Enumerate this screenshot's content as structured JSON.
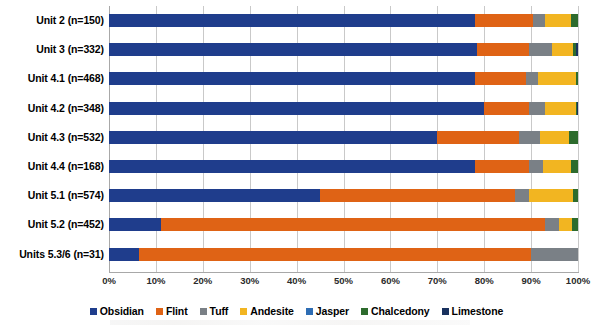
{
  "chart_data": {
    "type": "bar",
    "orientation": "horizontal",
    "stacked": true,
    "normalized": "percent",
    "title": "",
    "subtitle": "",
    "xlabel": "",
    "ylabel": "",
    "xlim": [
      0,
      100
    ],
    "grid": true,
    "legend_position": "bottom",
    "categories": [
      "Unit 2 (n=150)",
      "Unit 3 (n=332)",
      "Unit 4.1 (n=468)",
      "Unit 4.2 (n=348)",
      "Unit 4.3 (n=532)",
      "Unit 4.4 (n=168)",
      "Unit 5.1 (n=574)",
      "Unit 5.2 (n=452)",
      "Units 5.3/6 (n=31)"
    ],
    "xticks": [
      "0%",
      "10%",
      "20%",
      "30%",
      "40%",
      "50%",
      "60%",
      "70%",
      "80%",
      "90%",
      "100%"
    ],
    "xtick_values": [
      0,
      10,
      20,
      30,
      40,
      50,
      60,
      70,
      80,
      90,
      100
    ],
    "series": [
      {
        "name": "Obsidian",
        "color": "#1f3d8c",
        "values": [
          78.0,
          78.5,
          78.0,
          80.0,
          70.0,
          78.0,
          45.0,
          11.0,
          6.5
        ]
      },
      {
        "name": "Flint",
        "color": "#df6315",
        "values": [
          12.5,
          11.0,
          11.0,
          9.5,
          17.5,
          11.5,
          41.5,
          82.0,
          83.5
        ]
      },
      {
        "name": "Tuff",
        "color": "#7a8086",
        "values": [
          2.5,
          5.0,
          2.5,
          3.5,
          4.5,
          3.0,
          3.0,
          3.0,
          10.0
        ]
      },
      {
        "name": "Andesite",
        "color": "#f2b521",
        "values": [
          5.5,
          4.5,
          8.0,
          6.5,
          6.0,
          6.0,
          9.5,
          2.8,
          0.0
        ]
      },
      {
        "name": "Jasper",
        "color": "#2e6db4",
        "values": [
          0.0,
          0.0,
          0.0,
          0.0,
          0.0,
          0.0,
          0.0,
          0.0,
          0.0
        ]
      },
      {
        "name": "Chalcedony",
        "color": "#2d6b2d",
        "values": [
          1.5,
          0.6,
          0.5,
          0.3,
          2.0,
          1.5,
          1.0,
          1.2,
          0.0
        ]
      },
      {
        "name": "Limestone",
        "color": "#19315e",
        "values": [
          0.0,
          0.4,
          0.0,
          0.2,
          0.0,
          0.0,
          0.0,
          0.0,
          0.0
        ]
      }
    ]
  },
  "legend": {
    "items": [
      {
        "label": "Obsidian",
        "color": "#1f3d8c"
      },
      {
        "label": "Flint",
        "color": "#df6315"
      },
      {
        "label": "Tuff",
        "color": "#7a8086"
      },
      {
        "label": "Andesite",
        "color": "#f2b521"
      },
      {
        "label": "Jasper",
        "color": "#2e6db4"
      },
      {
        "label": "Chalcedony",
        "color": "#2d6b2d"
      },
      {
        "label": "Limestone",
        "color": "#19315e"
      }
    ]
  },
  "style": {
    "gridline_color": "#c9c9c9",
    "axis_color": "#a8a8a8",
    "background": "#ffffff",
    "text_color": "#000000"
  }
}
